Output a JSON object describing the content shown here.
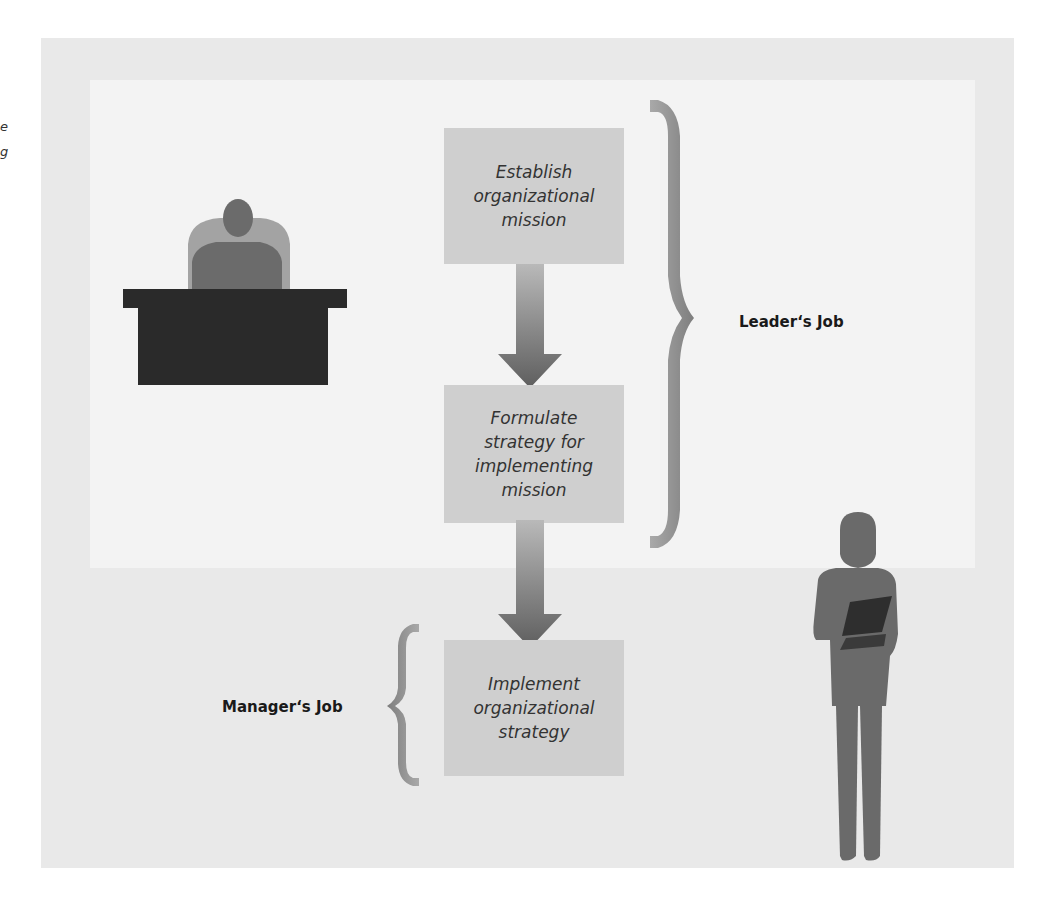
{
  "diagram": {
    "steps": [
      {
        "label": "Establish\norganizational\nmission"
      },
      {
        "label": "Formulate\nstrategy for\nimplementing\nmission"
      },
      {
        "label": "Implement\norganizational\nstrategy"
      }
    ],
    "brackets": {
      "leader": {
        "label": "Leader‘s Job",
        "spans_steps": [
          1,
          2
        ]
      },
      "manager": {
        "label": "Manager‘s Job",
        "spans_steps": [
          3
        ]
      }
    },
    "figures": {
      "seated": "person-at-desk",
      "standing": "person-holding-folder"
    }
  },
  "edge_text": {
    "fragment_1": "e",
    "fragment_2": "g"
  }
}
